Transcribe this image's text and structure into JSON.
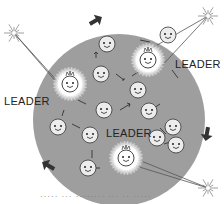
{
  "diagram": {
    "background_color": "#ffffff",
    "crowd_circle": {
      "cx": 119,
      "cy": 120,
      "r": 86,
      "color": "#9e9e9e"
    },
    "labels": [
      {
        "text": "LEADER",
        "x": 175,
        "y": 64
      },
      {
        "text": "LEADER",
        "x": 4,
        "y": 101
      },
      {
        "text": "LEADER",
        "x": 106,
        "y": 133
      }
    ],
    "leaders": [
      {
        "name": "leader-top",
        "cx": 148,
        "cy": 60
      },
      {
        "name": "leader-left",
        "cx": 70,
        "cy": 84
      },
      {
        "name": "leader-bottom",
        "cx": 126,
        "cy": 158
      }
    ],
    "stars": [
      {
        "name": "star-top-left",
        "cx": 14,
        "cy": 33
      },
      {
        "name": "star-top-right",
        "cx": 208,
        "cy": 16
      },
      {
        "name": "star-bottom-right",
        "cx": 208,
        "cy": 188
      }
    ],
    "faces": [
      {
        "cx": 107,
        "cy": 44
      },
      {
        "cx": 101,
        "cy": 74
      },
      {
        "cx": 138,
        "cy": 90
      },
      {
        "cx": 104,
        "cy": 110
      },
      {
        "cx": 149,
        "cy": 111
      },
      {
        "cx": 173,
        "cy": 127
      },
      {
        "cx": 58,
        "cy": 127
      },
      {
        "cx": 90,
        "cy": 135
      },
      {
        "cx": 157,
        "cy": 138
      },
      {
        "cx": 176,
        "cy": 145
      },
      {
        "cx": 88,
        "cy": 168
      },
      {
        "cx": 168,
        "cy": 35
      }
    ],
    "corner_arrows": [
      {
        "name": "arrow-top",
        "x": 95,
        "y": 21,
        "rotation": -30
      },
      {
        "name": "arrow-bottom-left",
        "x": 49,
        "y": 166,
        "rotation": 210
      },
      {
        "name": "arrow-bottom-right",
        "x": 207,
        "y": 133,
        "rotation": 100
      }
    ],
    "caption": "·····  ···  ········  ··· ·· ·····"
  }
}
